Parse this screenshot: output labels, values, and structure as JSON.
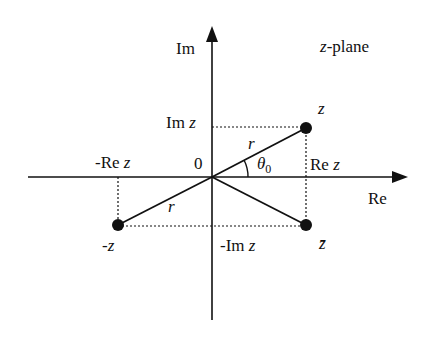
{
  "title": "z-plane",
  "axes": {
    "imag_label": "Im",
    "real_label": "Re",
    "origin_label": "0"
  },
  "points": {
    "z": "z",
    "neg_z": "-z",
    "conj_z": "z̄"
  },
  "projections": {
    "im_z": "Im z",
    "re_z": "Re z",
    "neg_re_z": "-Re z",
    "neg_im_z": "-Im z"
  },
  "annotations": {
    "r_upper": "r",
    "r_lower": "r",
    "angle": "θ0"
  },
  "labels": {
    "z_italic": "z",
    "plane_rest": "-plane",
    "im_prefix": "Im ",
    "re_prefix": "Re ",
    "negre_prefix": "-Re ",
    "negim_prefix": "-Im ",
    "theta": "θ",
    "theta_sub": "0"
  }
}
